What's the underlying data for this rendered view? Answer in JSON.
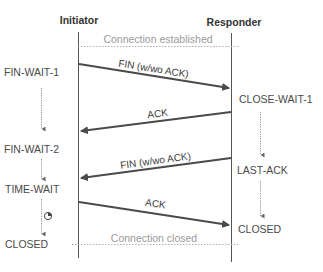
{
  "diagram": {
    "type": "sequence",
    "participants": {
      "initiator": "Initiator",
      "responder": "Responder"
    },
    "notes": {
      "established": "Connection established",
      "closed": "Connection closed"
    },
    "messages": [
      {
        "label": "FIN (w/wo ACK)",
        "from": "Initiator",
        "to": "Responder"
      },
      {
        "label": "ACK",
        "from": "Responder",
        "to": "Initiator"
      },
      {
        "label": "FIN (w/wo ACK)",
        "from": "Responder",
        "to": "Initiator"
      },
      {
        "label": "ACK",
        "from": "Initiator",
        "to": "Responder"
      }
    ],
    "initiator_states": [
      "FIN-WAIT-1",
      "FIN-WAIT-2",
      "TIME-WAIT",
      "CLOSED"
    ],
    "responder_states": [
      "CLOSE-WAIT-1",
      "LAST-ACK",
      "CLOSED"
    ],
    "icons": {
      "timer": "timer-icon"
    },
    "colors": {
      "line": "#555555",
      "arrow": "#4a4a4a",
      "dotted": "#b0b0b0",
      "note_text": "#9a9a9a"
    }
  }
}
